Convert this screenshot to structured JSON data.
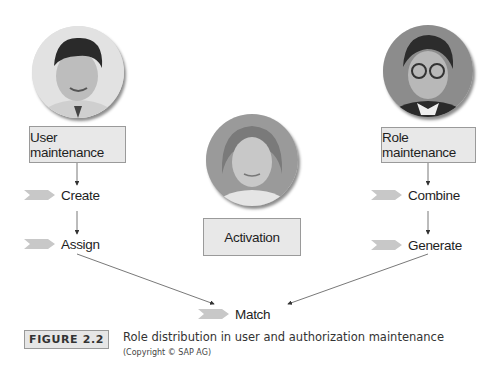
{
  "diagram": {
    "left_column": {
      "avatar": "person-photo-user-admin",
      "box_label": "User maintenance",
      "steps": [
        "Create",
        "Assign"
      ]
    },
    "center_column": {
      "avatar": "person-photo-activation-admin",
      "box_label": "Activation"
    },
    "right_column": {
      "avatar": "person-photo-role-admin",
      "box_label": "Role maintenance",
      "steps": [
        "Combine",
        "Generate"
      ]
    },
    "merge_step": "Match",
    "colors": {
      "box_fill": "#e8e8e8",
      "box_border": "#9a9a9a",
      "chevron": "#c8c8c8",
      "arrow": "#333333"
    }
  },
  "figure": {
    "label": "FIGURE 2.2",
    "caption": "Role distribution in user and authorization maintenance",
    "copyright": "(Copyright © SAP AG)"
  }
}
